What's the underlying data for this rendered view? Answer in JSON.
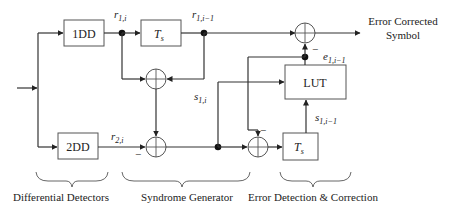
{
  "diagram": {
    "title": "",
    "blocks": {
      "dd1": {
        "label": "1DD"
      },
      "dd2": {
        "label": "2DD"
      },
      "ts_top": {
        "label": "T",
        "sub": "s"
      },
      "ts_bottom": {
        "label": "T",
        "sub": "s"
      },
      "lut": {
        "label": "LUT"
      }
    },
    "signals": {
      "r1i": {
        "base": "r",
        "sub": "1,i"
      },
      "r1im1": {
        "base": "r",
        "sub": "1,i−1"
      },
      "r2i": {
        "base": "r",
        "sub": "2,i"
      },
      "s1i": {
        "base": "s",
        "sub": "1,i"
      },
      "s1im1": {
        "base": "s",
        "sub": "1,i−1"
      },
      "e1im1": {
        "base": "e",
        "sub": "1,i−1"
      }
    },
    "signs": {
      "minus": "−"
    },
    "output": {
      "line1": "Error Corrected",
      "line2": "Symbol"
    },
    "groups": [
      {
        "label": "Differential Detectors"
      },
      {
        "label": "Syndrome Generator"
      },
      {
        "label": "Error Detection & Correction"
      }
    ]
  }
}
